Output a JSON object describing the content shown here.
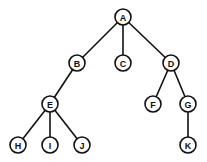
{
  "diagram": {
    "type": "tree",
    "node_radius": 8,
    "nodes": [
      {
        "id": "A",
        "label": "A",
        "x": 123,
        "y": 17
      },
      {
        "id": "B",
        "label": "B",
        "x": 77,
        "y": 63
      },
      {
        "id": "C",
        "label": "C",
        "x": 123,
        "y": 63
      },
      {
        "id": "D",
        "label": "D",
        "x": 171,
        "y": 63
      },
      {
        "id": "E",
        "label": "E",
        "x": 50,
        "y": 104
      },
      {
        "id": "F",
        "label": "F",
        "x": 153,
        "y": 104
      },
      {
        "id": "G",
        "label": "G",
        "x": 188,
        "y": 104
      },
      {
        "id": "H",
        "label": "H",
        "x": 18,
        "y": 145
      },
      {
        "id": "I",
        "label": "I",
        "x": 50,
        "y": 145
      },
      {
        "id": "J",
        "label": "J",
        "x": 82,
        "y": 145
      },
      {
        "id": "K",
        "label": "K",
        "x": 188,
        "y": 145
      }
    ],
    "edges": [
      [
        "A",
        "B"
      ],
      [
        "A",
        "C"
      ],
      [
        "A",
        "D"
      ],
      [
        "B",
        "E"
      ],
      [
        "D",
        "F"
      ],
      [
        "D",
        "G"
      ],
      [
        "E",
        "H"
      ],
      [
        "E",
        "I"
      ],
      [
        "E",
        "J"
      ],
      [
        "G",
        "K"
      ]
    ]
  }
}
